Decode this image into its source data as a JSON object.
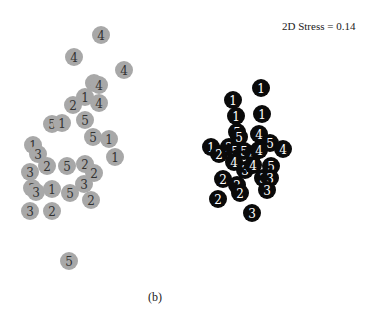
{
  "chart_data": {
    "type": "scatter",
    "title": "",
    "annotation": "2D Stress = 0.14",
    "caption": "(b)",
    "xlabel": "",
    "ylabel": "",
    "grid": false,
    "marker_radius": 9,
    "series": [
      {
        "name": "gray-group",
        "fill": "#a8a8a8",
        "text_color": "#333333",
        "points": [
          {
            "x": 101,
            "y": 35,
            "label": "4"
          },
          {
            "x": 74,
            "y": 57,
            "label": "4"
          },
          {
            "x": 124,
            "y": 70,
            "label": "4"
          },
          {
            "x": 94,
            "y": 83,
            "label": "4"
          },
          {
            "x": 99,
            "y": 85,
            "label": "4"
          },
          {
            "x": 85,
            "y": 97,
            "label": "1"
          },
          {
            "x": 73,
            "y": 105,
            "label": "2"
          },
          {
            "x": 99,
            "y": 103,
            "label": "4"
          },
          {
            "x": 52,
            "y": 124,
            "label": "5"
          },
          {
            "x": 62,
            "y": 123,
            "label": "1"
          },
          {
            "x": 85,
            "y": 120,
            "label": "5"
          },
          {
            "x": 93,
            "y": 137,
            "label": "5"
          },
          {
            "x": 109,
            "y": 139,
            "label": "1"
          },
          {
            "x": 115,
            "y": 157,
            "label": "1"
          },
          {
            "x": 33,
            "y": 145,
            "label": "1"
          },
          {
            "x": 38,
            "y": 154,
            "label": "3"
          },
          {
            "x": 47,
            "y": 166,
            "label": "2"
          },
          {
            "x": 30,
            "y": 172,
            "label": "3"
          },
          {
            "x": 67,
            "y": 166,
            "label": "5"
          },
          {
            "x": 85,
            "y": 164,
            "label": "2"
          },
          {
            "x": 94,
            "y": 173,
            "label": "2"
          },
          {
            "x": 84,
            "y": 184,
            "label": "3"
          },
          {
            "x": 32,
            "y": 188,
            "label": "3"
          },
          {
            "x": 36,
            "y": 192,
            "label": "3"
          },
          {
            "x": 52,
            "y": 189,
            "label": "1"
          },
          {
            "x": 70,
            "y": 193,
            "label": "5"
          },
          {
            "x": 91,
            "y": 200,
            "label": "2"
          },
          {
            "x": 30,
            "y": 211,
            "label": "3"
          },
          {
            "x": 52,
            "y": 211,
            "label": "2"
          },
          {
            "x": 69,
            "y": 261,
            "label": "5"
          }
        ]
      },
      {
        "name": "black-group",
        "fill": "#0a0a0a",
        "text_color": "#ffffff",
        "points": [
          {
            "x": 261,
            "y": 88,
            "label": "1"
          },
          {
            "x": 233,
            "y": 100,
            "label": "1"
          },
          {
            "x": 236,
            "y": 116,
            "label": "1"
          },
          {
            "x": 262,
            "y": 114,
            "label": "1"
          },
          {
            "x": 237,
            "y": 132,
            "label": "5"
          },
          {
            "x": 239,
            "y": 137,
            "label": "5"
          },
          {
            "x": 259,
            "y": 134,
            "label": "4"
          },
          {
            "x": 270,
            "y": 143,
            "label": "5"
          },
          {
            "x": 283,
            "y": 149,
            "label": "4"
          },
          {
            "x": 211,
            "y": 147,
            "label": "1"
          },
          {
            "x": 219,
            "y": 154,
            "label": "2"
          },
          {
            "x": 229,
            "y": 147,
            "label": "2"
          },
          {
            "x": 235,
            "y": 151,
            "label": "5"
          },
          {
            "x": 244,
            "y": 151,
            "label": "5"
          },
          {
            "x": 253,
            "y": 154,
            "label": "4"
          },
          {
            "x": 259,
            "y": 150,
            "label": "4"
          },
          {
            "x": 234,
            "y": 162,
            "label": "4"
          },
          {
            "x": 245,
            "y": 170,
            "label": "3"
          },
          {
            "x": 253,
            "y": 165,
            "label": "4"
          },
          {
            "x": 271,
            "y": 166,
            "label": "5"
          },
          {
            "x": 263,
            "y": 178,
            "label": "3"
          },
          {
            "x": 270,
            "y": 178,
            "label": "3"
          },
          {
            "x": 267,
            "y": 190,
            "label": "3"
          },
          {
            "x": 223,
            "y": 179,
            "label": "2"
          },
          {
            "x": 237,
            "y": 185,
            "label": "2"
          },
          {
            "x": 240,
            "y": 193,
            "label": "2"
          },
          {
            "x": 218,
            "y": 199,
            "label": "2"
          },
          {
            "x": 252,
            "y": 213,
            "label": "3"
          }
        ]
      }
    ]
  }
}
